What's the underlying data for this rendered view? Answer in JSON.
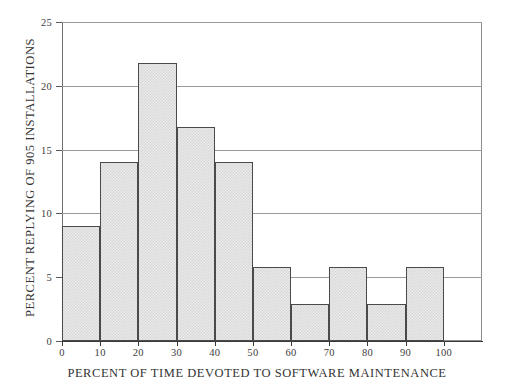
{
  "chart_data": {
    "type": "bar",
    "title": "",
    "subtitle": "",
    "xlabel": "PERCENT OF TIME DEVOTED TO SOFTWARE MAINTENANCE",
    "ylabel": "PERCENT REPLYING OF 905 INSTALLATIONS",
    "categories": [
      "0-10",
      "10-20",
      "20-30",
      "30-40",
      "40-50",
      "50-60",
      "60-70",
      "70-80",
      "80-90",
      "90-100"
    ],
    "bin_edges": [
      0,
      10,
      20,
      30,
      40,
      50,
      60,
      70,
      80,
      90,
      100
    ],
    "values": [
      9,
      14,
      21.8,
      16.8,
      14,
      5.8,
      2.9,
      5.8,
      2.9,
      5.8
    ],
    "xlim": [
      0,
      110
    ],
    "ylim": [
      0,
      25
    ],
    "xticks": [
      0,
      10,
      20,
      30,
      40,
      50,
      60,
      70,
      80,
      90,
      100
    ],
    "xtick_labels": [
      "0",
      "10",
      "20",
      "30",
      "40",
      "50",
      "60",
      "70",
      "80",
      "90",
      "100"
    ],
    "yticks": [
      0,
      5,
      10,
      15,
      20,
      25
    ],
    "ytick_labels": [
      "0",
      "5",
      "10",
      "15",
      "20",
      "25"
    ],
    "grid": "horizontal",
    "legend": "none",
    "bar_fill_color": "#e9e9e9",
    "bar_edge_color": "#4a4a4a",
    "grid_color": "#9a9a9a",
    "axis_color": "#3a3a3a",
    "background_color": "#ffffff"
  }
}
